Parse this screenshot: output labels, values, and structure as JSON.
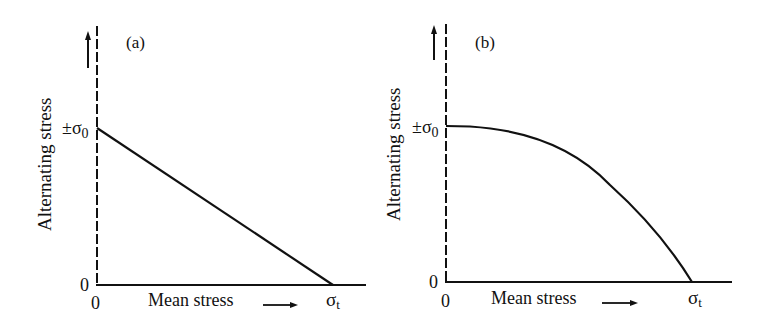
{
  "panels": [
    {
      "id": "a",
      "label": "(a)",
      "ylabel": "Alternating stress",
      "xlabel": "Mean stress",
      "y_tick_top": "±σ",
      "y_tick_top_sub": "0",
      "y_tick_zero": "0",
      "x_tick_zero": "0",
      "x_tick_end": "σ",
      "x_tick_end_sub": "t",
      "curve": "linear (Goodman line)"
    },
    {
      "id": "b",
      "label": "(b)",
      "ylabel": "Alternating stress",
      "xlabel": "Mean stress",
      "y_tick_top": "±σ",
      "y_tick_top_sub": "0",
      "y_tick_zero": "0",
      "x_tick_zero": "0",
      "x_tick_end": "σ",
      "x_tick_end_sub": "t",
      "curve": "parabolic (Gerber curve)"
    }
  ],
  "colors": {
    "line": "#111111",
    "background": "#ffffff"
  }
}
